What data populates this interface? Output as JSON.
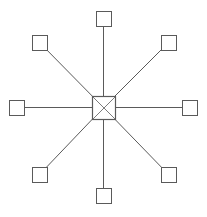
{
  "diagram": {
    "type": "star-topology",
    "canvas": {
      "width": 207,
      "height": 217,
      "background": "#ffffff"
    },
    "colors": {
      "stroke": "#5a5a5a",
      "node_fill": "#ffffff"
    },
    "hub": {
      "id": "hub",
      "shape": "square-with-x",
      "x": 92,
      "y": 96,
      "w": 23,
      "h": 23,
      "cx": 103.5,
      "cy": 107.5
    },
    "nodes": [
      {
        "id": "node-top",
        "x": 96,
        "y": 11,
        "w": 15,
        "h": 15,
        "cx": 103.5,
        "cy": 18.5
      },
      {
        "id": "node-top-right",
        "x": 161,
        "y": 35,
        "w": 15,
        "h": 15,
        "cx": 168.5,
        "cy": 42.5
      },
      {
        "id": "node-right",
        "x": 182,
        "y": 100,
        "w": 15,
        "h": 15,
        "cx": 189.5,
        "cy": 107.5
      },
      {
        "id": "node-bottom-right",
        "x": 161,
        "y": 167,
        "w": 15,
        "h": 15,
        "cx": 168.5,
        "cy": 174.5
      },
      {
        "id": "node-bottom",
        "x": 96,
        "y": 188,
        "w": 15,
        "h": 15,
        "cx": 103.5,
        "cy": 195.5
      },
      {
        "id": "node-bottom-left",
        "x": 32,
        "y": 167,
        "w": 15,
        "h": 15,
        "cx": 39.5,
        "cy": 174.5
      },
      {
        "id": "node-left",
        "x": 9,
        "y": 100,
        "w": 15,
        "h": 15,
        "cx": 16.5,
        "cy": 107.5
      },
      {
        "id": "node-top-left",
        "x": 32,
        "y": 35,
        "w": 15,
        "h": 15,
        "cx": 39.5,
        "cy": 42.5
      }
    ],
    "edges": [
      {
        "from": "hub",
        "to": "node-top"
      },
      {
        "from": "hub",
        "to": "node-top-right"
      },
      {
        "from": "hub",
        "to": "node-right"
      },
      {
        "from": "hub",
        "to": "node-bottom-right"
      },
      {
        "from": "hub",
        "to": "node-bottom"
      },
      {
        "from": "hub",
        "to": "node-bottom-left"
      },
      {
        "from": "hub",
        "to": "node-left"
      },
      {
        "from": "hub",
        "to": "node-top-left"
      }
    ]
  }
}
